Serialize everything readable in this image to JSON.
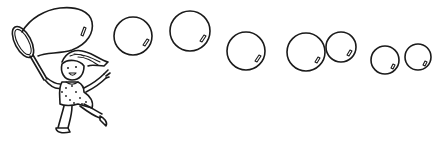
{
  "scene": {
    "description": "Line-art illustration of a girl running with a bubble wand, trailing a large bubble, with a row of bubbles floating to the right",
    "background_color": "#ffffff",
    "ink_color": "#1a1a1a"
  },
  "figure": {
    "subject": "girl",
    "action": "running",
    "holding": "bubble-wand",
    "dress_pattern": "polka-dot"
  },
  "bubbles": [
    {
      "cx": 133,
      "cy": 36,
      "r": 19
    },
    {
      "cx": 190,
      "cy": 31,
      "r": 20
    },
    {
      "cx": 246,
      "cy": 51,
      "r": 19
    },
    {
      "cx": 306,
      "cy": 52,
      "r": 19
    },
    {
      "cx": 341,
      "cy": 47,
      "r": 15
    },
    {
      "cx": 385,
      "cy": 60,
      "r": 14
    },
    {
      "cx": 418,
      "cy": 57,
      "r": 13
    }
  ]
}
